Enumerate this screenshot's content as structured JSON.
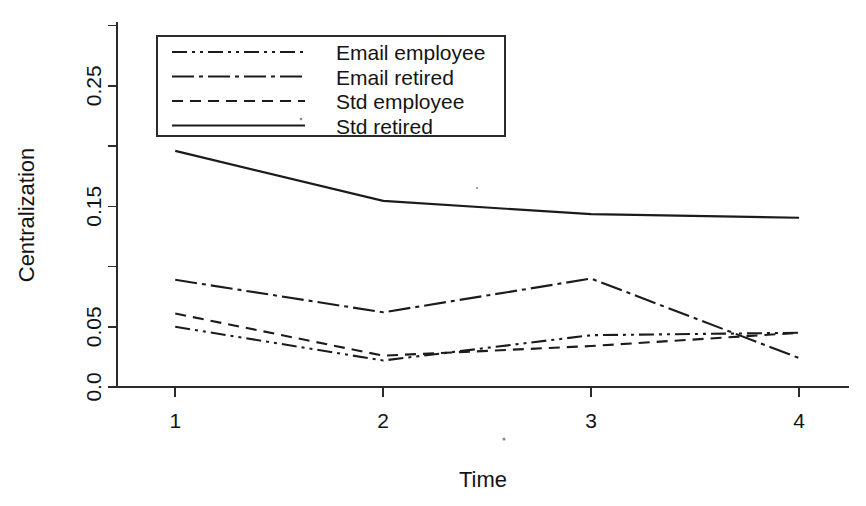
{
  "chart_data": {
    "type": "line",
    "title": "",
    "xlabel": "Time",
    "ylabel": "Centralization",
    "x": [
      1,
      2,
      3,
      4
    ],
    "categories": [
      "1",
      "2",
      "3",
      "4"
    ],
    "xlim": [
      0.72,
      4.24
    ],
    "ylim": [
      0.0,
      0.303
    ],
    "grid": false,
    "legend_position": "top-left inside plot area",
    "xtick_labels": [
      "1",
      "2",
      "3",
      "4"
    ],
    "ytick_values": [
      0.0,
      0.05,
      0.1,
      0.15,
      0.2,
      0.25,
      0.3
    ],
    "ytick_labels": [
      "0.0",
      "0.05",
      "",
      "0.15",
      "",
      "0.25",
      ""
    ],
    "series": [
      {
        "name": "Email employee",
        "dash": "dash-dot-dot",
        "values": [
          0.05,
          0.022,
          0.043,
          0.045
        ]
      },
      {
        "name": "Email retired",
        "dash": "dash-dot",
        "values": [
          0.089,
          0.062,
          0.09,
          0.024
        ]
      },
      {
        "name": "Std employee",
        "dash": "dashed",
        "values": [
          0.061,
          0.026,
          0.034,
          0.045
        ]
      },
      {
        "name": "Std retired",
        "dash": "solid",
        "values": [
          0.196,
          0.1545,
          0.1435,
          0.1405
        ]
      }
    ]
  },
  "legend": {
    "entries": [
      {
        "label": "Email employee",
        "dash": "dash-dot-dot"
      },
      {
        "label": "Email retired",
        "dash": "dash-dot"
      },
      {
        "label": "Std employee",
        "dash": "dashed"
      },
      {
        "label": "Std retired",
        "dash": "solid"
      }
    ]
  },
  "colors": {
    "ink": "#1b1b1b",
    "axis": "#2b2b2b",
    "background": "#ffffff"
  }
}
